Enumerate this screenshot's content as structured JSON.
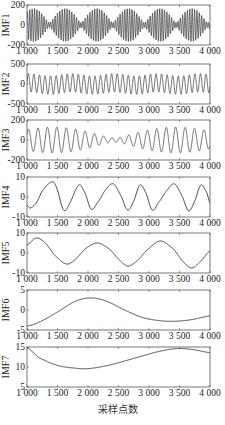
{
  "chart_data": {
    "type": "line",
    "title": "",
    "xlabel": "采样点数",
    "layout": {
      "panels": 7,
      "stacked": "vertical",
      "grid": false,
      "legend": "none"
    },
    "x_range": [
      1000,
      4000
    ],
    "x_ticks": [
      1000,
      1500,
      2000,
      2500,
      3000,
      3500,
      4000
    ],
    "x_tick_labels": [
      "1 000",
      "1 500",
      "2 000",
      "2 500",
      "3 000",
      "3 500",
      "4 000"
    ],
    "panels": [
      {
        "ylabel": "IMF1",
        "ylim": [
          -200,
          200
        ],
        "y_ticks": [
          -200,
          0,
          200
        ],
        "y_tick_labels": [
          "-200",
          "0",
          "200"
        ],
        "description": "High-frequency oscillation, amplitude ≈ ±180, bursts in groups (~14 groups across range)",
        "model": {
          "components": [
            {
              "amp": 95,
              "period": 38
            },
            {
              "amp": 70,
              "period": 41
            }
          ],
          "offset": 0
        }
      },
      {
        "ylabel": "IMF2",
        "ylim": [
          -500,
          500
        ],
        "y_ticks": [
          -500,
          0,
          500
        ],
        "y_tick_labels": [
          "-500",
          "0",
          "500"
        ],
        "description": "Regular oscillation, ~33 cycles, amplitude ≈ ±250",
        "model": {
          "components": [
            {
              "amp": 230,
              "period": 91
            },
            {
              "amp": 30,
              "period": 700
            }
          ],
          "offset": 0
        }
      },
      {
        "ylabel": "IMF3",
        "ylim": [
          -200,
          200
        ],
        "y_ticks": [
          -200,
          0,
          200
        ],
        "y_tick_labels": [
          "-200",
          "0",
          "200"
        ],
        "description": "Beating oscillation, ~20 cycles, amplitude 40–130",
        "model": {
          "components": [
            {
              "amp": 75,
              "period": 150
            },
            {
              "amp": 55,
              "period": 162
            }
          ],
          "offset": 0
        }
      },
      {
        "ylabel": "IMF4",
        "ylim": [
          -10,
          10
        ],
        "y_ticks": [
          -10,
          0,
          10
        ],
        "y_tick_labels": [
          "-10",
          "0",
          "10"
        ],
        "description": "Slow oscillation, ~6 cycles, peaks ≈ 7–8 near x≈1400,1850,2400,2850,3400,3850",
        "points": [
          [
            1000,
            -4
          ],
          [
            1050,
            -5.5
          ],
          [
            1150,
            -3
          ],
          [
            1250,
            3
          ],
          [
            1400,
            7.5
          ],
          [
            1480,
            5
          ],
          [
            1600,
            -6.5
          ],
          [
            1700,
            -3
          ],
          [
            1850,
            6
          ],
          [
            1950,
            2
          ],
          [
            2050,
            -6
          ],
          [
            2150,
            -3
          ],
          [
            2300,
            4
          ],
          [
            2420,
            6.5
          ],
          [
            2550,
            0
          ],
          [
            2650,
            -6.5
          ],
          [
            2750,
            -2
          ],
          [
            2850,
            6
          ],
          [
            2950,
            2
          ],
          [
            3050,
            -6.5
          ],
          [
            3150,
            -3
          ],
          [
            3300,
            3.5
          ],
          [
            3420,
            6.5
          ],
          [
            3550,
            0
          ],
          [
            3650,
            -7
          ],
          [
            3750,
            -2
          ],
          [
            3850,
            6
          ],
          [
            3950,
            2
          ],
          [
            4000,
            -3
          ]
        ]
      },
      {
        "ylabel": "IMF5",
        "ylim": [
          -10,
          10
        ],
        "y_ticks": [
          -10,
          0,
          10
        ],
        "y_tick_labels": [
          "-10",
          "0",
          "10"
        ],
        "description": "~3 cycles, peaks at x≈1150 (8), 2150 (5), 3180 (6); troughs at 1650 (-5), 2650 (-6.5), 3700 (-7.5)",
        "points": [
          [
            1000,
            4
          ],
          [
            1150,
            7.5
          ],
          [
            1300,
            5
          ],
          [
            1450,
            -1
          ],
          [
            1650,
            -5.5
          ],
          [
            1800,
            -3
          ],
          [
            1950,
            2
          ],
          [
            2150,
            5
          ],
          [
            2350,
            2
          ],
          [
            2500,
            -3
          ],
          [
            2650,
            -6.5
          ],
          [
            2800,
            -4
          ],
          [
            2950,
            1
          ],
          [
            3180,
            6
          ],
          [
            3400,
            2
          ],
          [
            3550,
            -4
          ],
          [
            3700,
            -7.5
          ],
          [
            3850,
            -4
          ],
          [
            4000,
            1
          ]
        ]
      },
      {
        "ylabel": "IMF6",
        "ylim": [
          -5,
          5
        ],
        "y_ticks": [
          -5,
          0,
          5
        ],
        "y_tick_labels": [
          "-5",
          "0",
          "5"
        ],
        "description": "Single slow wave: -4 at 1000, peak ≈ 3 at ~2050, trough ≈ -2.8 at ~3400, -1.5 at 4000",
        "points": [
          [
            1000,
            -4
          ],
          [
            1200,
            -3
          ],
          [
            1500,
            -0.5
          ],
          [
            1800,
            2.2
          ],
          [
            2050,
            3
          ],
          [
            2300,
            2.2
          ],
          [
            2600,
            0
          ],
          [
            2900,
            -1.9
          ],
          [
            3200,
            -2.7
          ],
          [
            3450,
            -2.8
          ],
          [
            3700,
            -2.4
          ],
          [
            4000,
            -1.5
          ]
        ]
      },
      {
        "ylabel": "IMF7",
        "ylim": [
          5,
          15
        ],
        "y_ticks": [
          5,
          10,
          15
        ],
        "y_tick_labels": [
          "5",
          "10",
          "15"
        ],
        "description": "Residual-like trend: 15 at 1000, min ≈ 9.6 at ~1950, max ≈ 14.6 at ~3450, 13.6 at 4000",
        "points": [
          [
            1000,
            14.8
          ],
          [
            1200,
            12.3
          ],
          [
            1500,
            10.4
          ],
          [
            1800,
            9.7
          ],
          [
            2000,
            9.6
          ],
          [
            2300,
            10.3
          ],
          [
            2600,
            11.5
          ],
          [
            2900,
            12.8
          ],
          [
            3200,
            14
          ],
          [
            3450,
            14.6
          ],
          [
            3700,
            14.4
          ],
          [
            4000,
            13.6
          ]
        ]
      }
    ]
  },
  "figure": {
    "plot_left": 27,
    "plot_right": 210,
    "panel_tops": [
      5,
      64,
      120,
      177,
      233,
      290,
      347
    ],
    "panel_height": 40,
    "line_color": "#333333",
    "axis_color": "#555555"
  }
}
